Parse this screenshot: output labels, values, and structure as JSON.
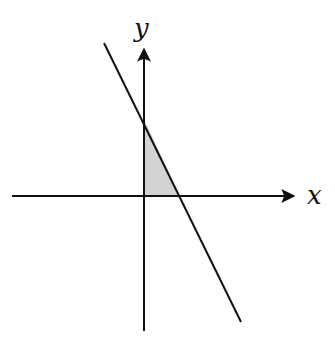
{
  "diagram": {
    "type": "coordinate-plane",
    "axes": {
      "x_label": "x",
      "y_label": "y",
      "origin": [
        144,
        196
      ],
      "x_axis": {
        "from": [
          12,
          196
        ],
        "to": [
          296,
          196
        ]
      },
      "y_axis": {
        "from": [
          144,
          331
        ],
        "to": [
          144,
          47
        ]
      }
    },
    "line": {
      "from": [
        104,
        43
      ],
      "to": [
        241,
        322
      ],
      "y_intercept_point": [
        144,
        119
      ],
      "x_intercept_point": [
        180,
        196
      ]
    },
    "shaded_region": {
      "description": "Triangle bounded by the line and the positive x and y axes (first quadrant)",
      "vertices": [
        [
          144,
          196
        ],
        [
          144,
          119
        ],
        [
          180,
          196
        ]
      ],
      "fill": "#d3d3d3"
    },
    "colors": {
      "stroke": "#111111",
      "fill": "#d3d3d3",
      "background": "#ffffff"
    }
  }
}
